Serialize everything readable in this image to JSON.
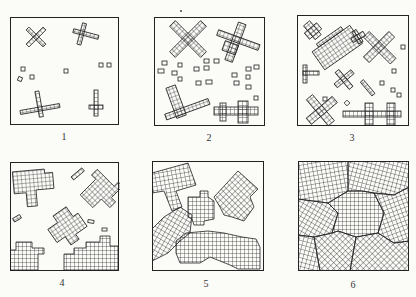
{
  "figure": {
    "panels": [
      {
        "id": 1,
        "label": "1"
      },
      {
        "id": 2,
        "label": "2"
      },
      {
        "id": 3,
        "label": "3"
      },
      {
        "id": 4,
        "label": "4"
      },
      {
        "id": 5,
        "label": "5"
      },
      {
        "id": 6,
        "label": "6"
      }
    ]
  },
  "colors": {
    "line": "#222222",
    "background": "#fbfbf8"
  }
}
